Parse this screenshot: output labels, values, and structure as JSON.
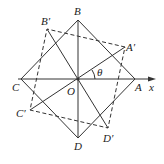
{
  "diagram": {
    "title": "",
    "labels": {
      "A": "A",
      "B": "B",
      "C": "C",
      "D": "D",
      "A_prime": "A′",
      "B_prime": "B′",
      "C_prime": "C′",
      "D_prime": "D′",
      "O": "O",
      "x": "x",
      "theta": "θ"
    },
    "points": {
      "O": [
        78,
        79
      ],
      "A": [
        135,
        79
      ],
      "B": [
        78,
        20
      ],
      "C": [
        21,
        79
      ],
      "D": [
        78,
        138
      ],
      "A_prime": [
        125,
        47
      ],
      "B_prime": [
        47,
        29
      ],
      "C_prime": [
        30,
        110
      ],
      "D_prime": [
        108,
        128
      ]
    },
    "colors": {
      "line": "#333333",
      "background": "#ffffff"
    }
  }
}
